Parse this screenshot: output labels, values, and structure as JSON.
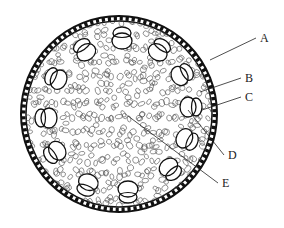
{
  "diagram": {
    "type": "cross-section",
    "center": [
      119,
      114
    ],
    "outer_radius": 99,
    "labels": [
      {
        "id": "A",
        "text": "A",
        "pos": [
          260,
          42
        ],
        "target": [
          210,
          60
        ]
      },
      {
        "id": "B",
        "text": "B",
        "pos": [
          245,
          82
        ],
        "target": [
          200,
          92
        ]
      },
      {
        "id": "C",
        "text": "C",
        "pos": [
          245,
          101
        ],
        "target": [
          202,
          110
        ]
      },
      {
        "id": "D",
        "text": "D",
        "pos": [
          228,
          159
        ],
        "target": [
          188,
          110
        ]
      },
      {
        "id": "E",
        "text": "E",
        "pos": [
          222,
          187
        ],
        "target": [
          128,
          116
        ]
      }
    ],
    "bundles": [
      {
        "cx": 122,
        "cy": 37,
        "rot": 0
      },
      {
        "cx": 160,
        "cy": 49,
        "rot": 35
      },
      {
        "cx": 183,
        "cy": 74,
        "rot": 60
      },
      {
        "cx": 192,
        "cy": 107,
        "rot": 90
      },
      {
        "cx": 188,
        "cy": 140,
        "rot": 115
      },
      {
        "cx": 171,
        "cy": 170,
        "rot": 140
      },
      {
        "cx": 128,
        "cy": 193,
        "rot": 180
      },
      {
        "cx": 87,
        "cy": 186,
        "rot": 200
      },
      {
        "cx": 54,
        "cy": 153,
        "rot": 235
      },
      {
        "cx": 45,
        "cy": 118,
        "rot": 270
      },
      {
        "cx": 55,
        "cy": 78,
        "rot": 295
      },
      {
        "cx": 84,
        "cy": 49,
        "rot": 325
      }
    ]
  }
}
